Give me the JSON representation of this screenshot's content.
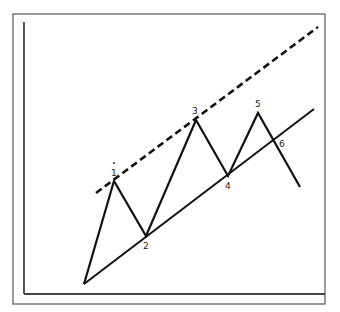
{
  "diagram": {
    "type": "wave-pattern-chart",
    "frame": {
      "x": 13,
      "y": 14,
      "w": 312,
      "h": 290,
      "color": "#555555"
    },
    "axes": {
      "y_axis": {
        "x": 24,
        "y1": 22,
        "y2": 294
      },
      "x_axis": {
        "y": 294,
        "x1": 24,
        "x2": 325
      },
      "color": "#444444"
    },
    "price_path": {
      "points": [
        [
          84,
          284
        ],
        [
          114,
          181
        ],
        [
          146,
          236
        ],
        [
          196,
          120
        ],
        [
          228,
          176
        ],
        [
          258,
          113
        ],
        [
          300,
          187
        ]
      ],
      "color": "#111111"
    },
    "support_line": {
      "x1": 84,
      "y1": 284,
      "x2": 314,
      "y2": 109,
      "color": "#111111",
      "style": "solid"
    },
    "resistance_line": {
      "x1": 96,
      "y1": 193,
      "x2": 318,
      "y2": 27,
      "color": "#111111",
      "style": "dashed"
    },
    "labels": [
      {
        "text": "1",
        "x": 111,
        "y": 176
      },
      {
        "text": "2",
        "x": 143,
        "y": 249
      },
      {
        "text": "3",
        "x": 192,
        "y": 114
      },
      {
        "text": "4",
        "x": 225,
        "y": 189
      },
      {
        "text": "5",
        "x": 255,
        "y": 107
      },
      {
        "text": "6",
        "x": 279,
        "y": 147
      }
    ],
    "label_1_dot": {
      "x": 114,
      "y": 163
    }
  }
}
